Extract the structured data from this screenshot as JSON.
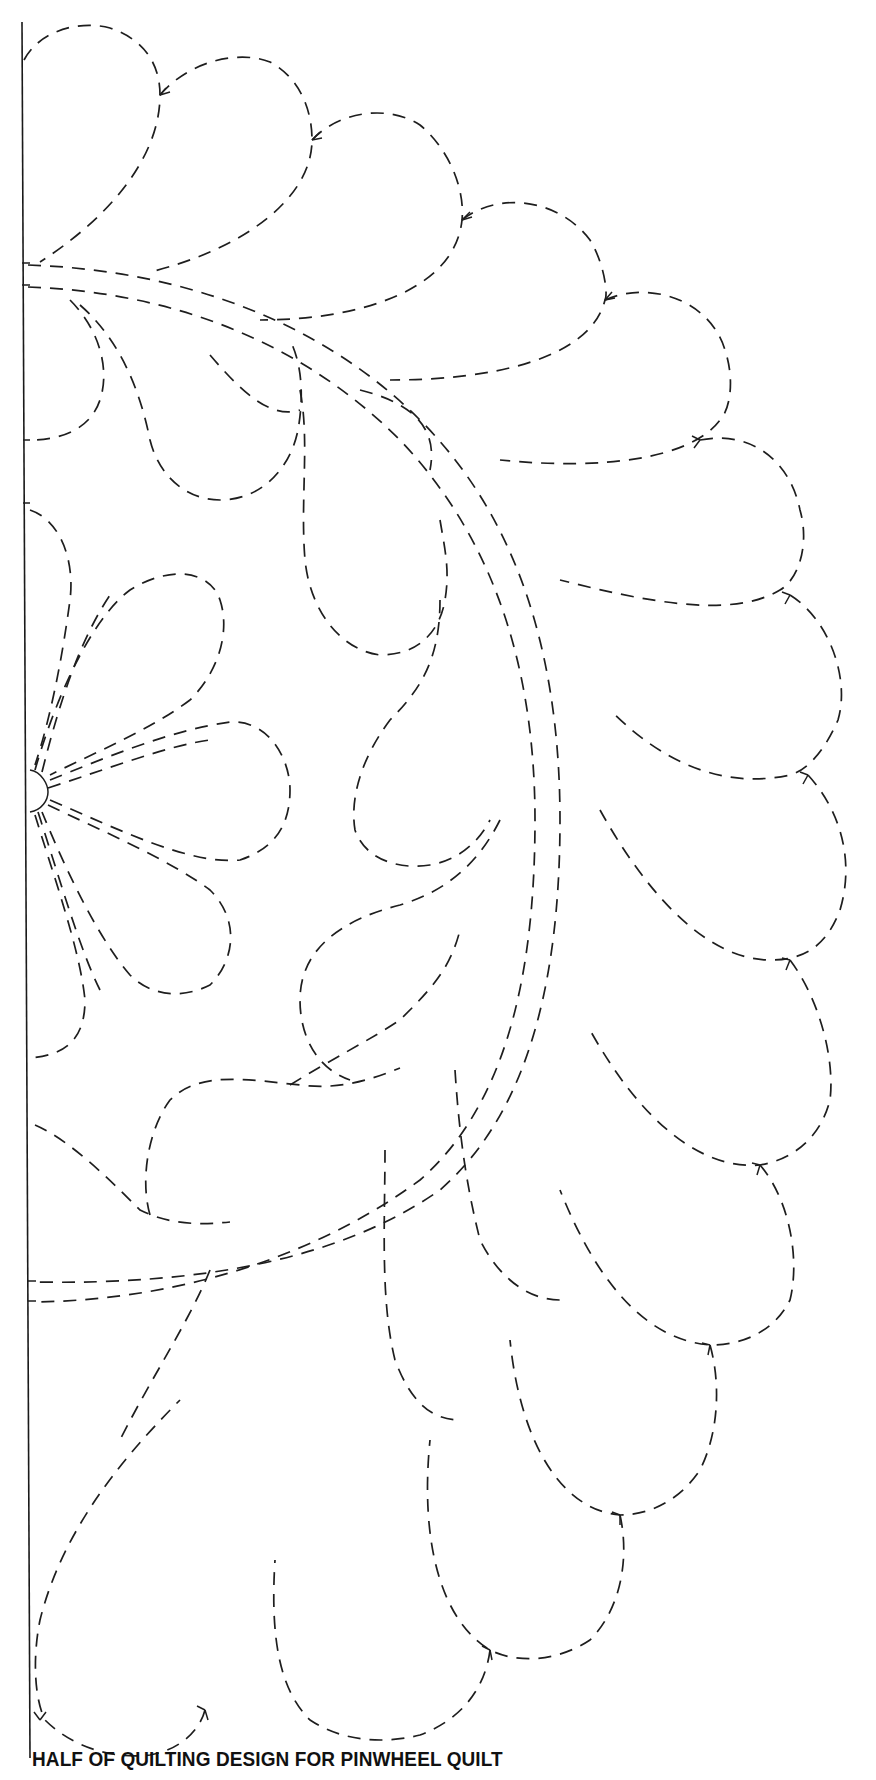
{
  "document": {
    "caption": "HALF OF QUILTING DESIGN FOR PINWHEEL QUILT",
    "colors": {
      "paper": "#ffffff",
      "ink": "#1e1e1e"
    },
    "pattern": {
      "type": "half quilting template",
      "elements": [
        "fold-line",
        "outer-feather-plumes",
        "double-stitched-arc",
        "inner-feathers",
        "center-flower-petals"
      ]
    }
  }
}
